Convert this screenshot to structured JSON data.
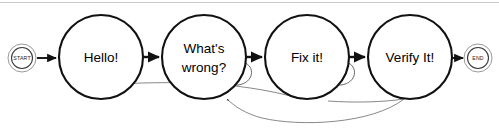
{
  "diagram": {
    "type": "state-machine-flowchart",
    "canvas": {
      "width": 499,
      "height": 130,
      "background": "#ffffff"
    },
    "stroke_color": "#111111",
    "curve_color": "#6a6a6a",
    "terminals": {
      "start": {
        "label": "START",
        "cx": 22,
        "cy": 58,
        "r_outer": 14,
        "r_inner": 10.5
      },
      "end": {
        "label": "END",
        "cx": 478,
        "cy": 58,
        "r_outer": 14,
        "r_inner": 10.5
      }
    },
    "nodes": [
      {
        "id": "hello",
        "label": "Hello!",
        "line1": "Hello!",
        "line2": "",
        "cx": 101,
        "cy": 57,
        "r": 42
      },
      {
        "id": "whats-wrong",
        "label": "What's wrong?",
        "line1": "What's",
        "line2": "wrong?",
        "cx": 204,
        "cy": 57,
        "r": 42
      },
      {
        "id": "fix-it",
        "label": "Fix it!",
        "line1": "Fix it!",
        "line2": "",
        "cx": 307,
        "cy": 57,
        "r": 42
      },
      {
        "id": "verify-it",
        "label": "Verify It!",
        "line1": "Verify It!",
        "line2": "",
        "cx": 410,
        "cy": 57,
        "r": 42
      }
    ],
    "transitions": [
      {
        "id": "t-start-hello",
        "from": "START",
        "to": "Hello!",
        "kind": "straight"
      },
      {
        "id": "t-hello-wrong",
        "from": "Hello!",
        "to": "What's wrong?",
        "kind": "straight"
      },
      {
        "id": "t-wrong-fix",
        "from": "What's wrong?",
        "to": "Fix it!",
        "kind": "straight"
      },
      {
        "id": "t-fix-verify",
        "from": "Fix it!",
        "to": "Verify It!",
        "kind": "straight"
      },
      {
        "id": "t-verify-end",
        "from": "Verify It!",
        "to": "END",
        "kind": "straight"
      },
      {
        "id": "t-wrong-self",
        "from": "What's wrong?",
        "to": "What's wrong?",
        "kind": "self-loop"
      },
      {
        "id": "t-fix-self",
        "from": "Fix it!",
        "to": "Fix it!",
        "kind": "self-loop"
      },
      {
        "id": "t-verify-back-wrong",
        "from": "Verify It!",
        "to": "What's wrong?",
        "kind": "long-feedback"
      },
      {
        "id": "t-fix-back",
        "from": "Fix it!",
        "to": "What's wrong?",
        "kind": "long-feedback"
      }
    ]
  }
}
